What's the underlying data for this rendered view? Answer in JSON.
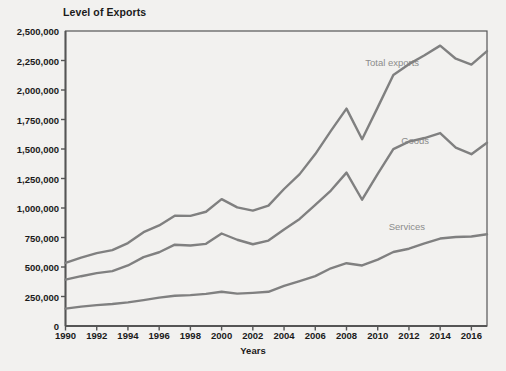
{
  "chart_data": {
    "type": "line",
    "title": "Level of Exports",
    "xlabel": "Years",
    "ylabel": "",
    "xlim": [
      1990,
      2017
    ],
    "ylim": [
      0,
      2500000
    ],
    "grid": false,
    "legend_position": "inline-annotations",
    "line_color": "#808080",
    "axis_color": "#555555",
    "background_color": "#f2f1ef",
    "x": [
      1990,
      1991,
      1992,
      1993,
      1994,
      1995,
      1996,
      1997,
      1998,
      1999,
      2000,
      2001,
      2002,
      2003,
      2004,
      2005,
      2006,
      2007,
      2008,
      2009,
      2010,
      2011,
      2012,
      2013,
      2014,
      2015,
      2016,
      2017
    ],
    "xticks": [
      1990,
      1992,
      1994,
      1996,
      1998,
      2000,
      2002,
      2004,
      2006,
      2008,
      2010,
      2012,
      2014,
      2016
    ],
    "xtick_labels": [
      "1990",
      "1992",
      "1994",
      "1996",
      "1998",
      "2000",
      "2002",
      "2004",
      "2006",
      "2008",
      "2010",
      "2012",
      "2014",
      "2016"
    ],
    "yticks": [
      0,
      250000,
      500000,
      750000,
      1000000,
      1250000,
      1500000,
      1750000,
      2000000,
      2250000,
      2500000
    ],
    "ytick_labels": [
      "0",
      "250,000",
      "500,000",
      "750,000",
      "1,000,000",
      "1,250,000",
      "1,500,000",
      "1,750,000",
      "2,000,000",
      "2,250,000",
      "2,500,000"
    ],
    "series": [
      {
        "name": "Total exports",
        "label_x": 2009.2,
        "label_y": 2220000,
        "values": [
          535000,
          580000,
          617000,
          643000,
          703000,
          795000,
          852000,
          934000,
          933000,
          968000,
          1075000,
          1005000,
          978000,
          1020000,
          1161000,
          1287000,
          1457000,
          1653000,
          1842000,
          1583000,
          1853000,
          2127000,
          2219000,
          2294000,
          2376000,
          2265000,
          2215000,
          2330000
        ]
      },
      {
        "name": "Goods",
        "label_x": 2011.5,
        "label_y": 1560000,
        "values": [
          393000,
          422000,
          448000,
          465000,
          513000,
          584000,
          625000,
          689000,
          682000,
          696000,
          784000,
          731000,
          693000,
          724000,
          818000,
          907000,
          1026000,
          1148000,
          1300000,
          1070000,
          1290000,
          1499000,
          1562000,
          1593000,
          1635000,
          1511000,
          1456000,
          1553000
        ]
      },
      {
        "name": "Services",
        "label_x": 2010.7,
        "label_y": 830000,
        "values": [
          147000,
          164000,
          177000,
          186000,
          200000,
          219000,
          240000,
          256000,
          262000,
          272000,
          290000,
          274000,
          281000,
          290000,
          340000,
          380000,
          423000,
          489000,
          532000,
          513000,
          563000,
          627000,
          655000,
          700000,
          741000,
          754000,
          759000,
          777000
        ]
      }
    ]
  },
  "annotations": {
    "title_text": "Level of Exports",
    "x_axis_title": "Years"
  }
}
